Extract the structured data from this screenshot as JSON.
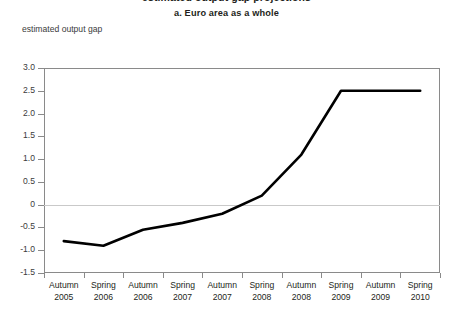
{
  "titles": {
    "main": "estimated output gap projections",
    "sub": "a.  Euro area as a whole",
    "axis_caption": "estimated output gap"
  },
  "colors": {
    "line": "#000000",
    "axis": "#8a8a8a",
    "zero_line": "#c9c9c9",
    "text": "#231f20",
    "background": "#ffffff"
  },
  "chart_data": {
    "type": "line",
    "title": "a.  Euro area as a whole",
    "xlabel": "",
    "ylabel": "estimated output gap",
    "ylim": [
      -1.5,
      3.0
    ],
    "ystep": 0.5,
    "grid": false,
    "zero_line": true,
    "legend": "none",
    "categories": [
      "Autumn 2005",
      "Spring 2006",
      "Autumn 2006",
      "Spring 2007",
      "Autumn 2007",
      "Spring 2008",
      "Autumn 2008",
      "Spring 2009",
      "Autumn 2009",
      "Spring 2010"
    ],
    "category_lines": [
      [
        "Autumn",
        "2005"
      ],
      [
        "Spring",
        "2006"
      ],
      [
        "Autumn",
        "2006"
      ],
      [
        "Spring",
        "2007"
      ],
      [
        "Autumn",
        "2007"
      ],
      [
        "Spring",
        "2008"
      ],
      [
        "Autumn",
        "2008"
      ],
      [
        "Spring",
        "2009"
      ],
      [
        "Autumn",
        "2009"
      ],
      [
        "Spring",
        "2010"
      ]
    ],
    "ytick_labels": [
      "3.0",
      "2.5",
      "2.0",
      "1.5",
      "1.0",
      "0.5",
      "0",
      "-0.5",
      "-1.0",
      "-1.5"
    ],
    "ytick_values": [
      3.0,
      2.5,
      2.0,
      1.5,
      1.0,
      0.5,
      0,
      -0.5,
      -1.0,
      -1.5
    ],
    "series": [
      {
        "name": "estimated output gap",
        "values": [
          -0.8,
          -0.9,
          -0.55,
          -0.4,
          -0.2,
          0.2,
          1.1,
          2.5,
          2.5,
          2.5
        ]
      }
    ]
  }
}
